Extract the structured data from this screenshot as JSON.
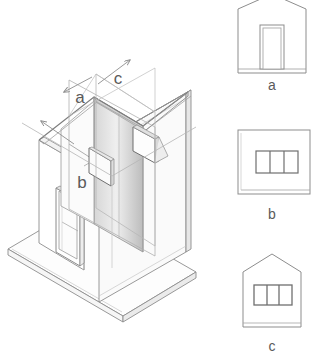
{
  "document": {
    "type": "architectural-drawing",
    "title": "",
    "description": "Axonometric cut-away of a small gabled house with three cutting planes and three corresponding orthographic elevations"
  },
  "colors": {
    "background": "#ffffff",
    "line": "#6b6b6b",
    "line_light": "#9a9a9a",
    "line_faint": "#b5b5b5",
    "label": "#5a5a5a",
    "wall_shade_dark": "#b9b9b9",
    "wall_shade_light": "#efefef",
    "plane_fill": "#f4f4f4",
    "slab_fill": "#fdfdfd"
  },
  "isometric": {
    "name": "cut-away-axonometric",
    "section_labels": [
      {
        "id": "a",
        "text": "a",
        "x": 84,
        "y": 101
      },
      {
        "id": "c",
        "text": "c",
        "x": 118,
        "y": 82
      },
      {
        "id": "b",
        "text": "b",
        "x": 81,
        "y": 186
      }
    ],
    "arrows": [
      {
        "id": "arrow-a",
        "direction": "down-left",
        "from_x": 90,
        "to_x": 62,
        "from_y": 78,
        "to_y": 92
      },
      {
        "id": "arrow-c",
        "direction": "up-right",
        "from_x": 97,
        "to_x": 130,
        "from_y": 83,
        "to_y": 61
      },
      {
        "id": "arrow-b",
        "direction": "up-left",
        "from_x": 74,
        "to_x": 40,
        "from_y": 144,
        "to_y": 121
      }
    ],
    "parts": [
      "ground-slab",
      "left-gable-wall",
      "right-long-wall",
      "interior-cut-wall",
      "roof-eaves",
      "door-opening",
      "window-opening-left",
      "window-opening-right",
      "section-plane-a",
      "section-plane-c"
    ]
  },
  "elevations": [
    {
      "id": "a",
      "label": "a",
      "name": "elevation-a",
      "shape": "gable",
      "opening": "door",
      "opening_panes": 1,
      "label_x": 272,
      "label_y": 87
    },
    {
      "id": "b",
      "label": "b",
      "name": "elevation-b",
      "shape": "rectangle",
      "opening": "window",
      "opening_panes": 3,
      "label_x": 272,
      "label_y": 217
    },
    {
      "id": "c",
      "label": "c",
      "name": "elevation-c",
      "shape": "gable",
      "opening": "window",
      "opening_panes": 3,
      "label_x": 272,
      "label_y": 350
    }
  ]
}
